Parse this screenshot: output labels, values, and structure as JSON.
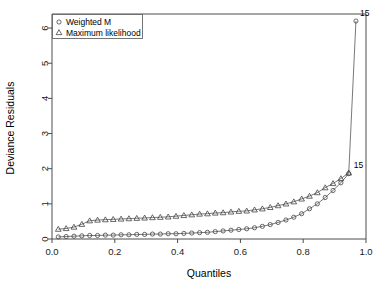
{
  "chart_data": {
    "type": "scatter",
    "title": "",
    "xlabel": "Quantiles",
    "ylabel": "Deviance Residuals",
    "xlim": [
      0.0,
      1.0
    ],
    "ylim": [
      0.0,
      6.4
    ],
    "xticks": [
      "0.0",
      "0.2",
      "0.4",
      "0.6",
      "0.8",
      "1.0"
    ],
    "xtick_values": [
      0.0,
      0.2,
      0.4,
      0.6,
      0.8,
      1.0
    ],
    "yticks": [
      "0",
      "1",
      "2",
      "3",
      "4",
      "5",
      "6"
    ],
    "ytick_values": [
      0,
      1,
      2,
      3,
      4,
      5,
      6
    ],
    "grid": false,
    "legend_position": "top-left",
    "series": [
      {
        "name": "Weighted M",
        "marker": "circle",
        "x": [
          0.02,
          0.045,
          0.07,
          0.095,
          0.12,
          0.145,
          0.17,
          0.195,
          0.22,
          0.245,
          0.27,
          0.295,
          0.32,
          0.345,
          0.37,
          0.395,
          0.42,
          0.445,
          0.47,
          0.495,
          0.52,
          0.545,
          0.57,
          0.595,
          0.62,
          0.645,
          0.67,
          0.695,
          0.72,
          0.745,
          0.77,
          0.795,
          0.82,
          0.845,
          0.87,
          0.895,
          0.92,
          0.945,
          0.968
        ],
        "y": [
          0.06,
          0.07,
          0.08,
          0.09,
          0.1,
          0.1,
          0.11,
          0.11,
          0.12,
          0.12,
          0.13,
          0.13,
          0.14,
          0.14,
          0.15,
          0.15,
          0.16,
          0.17,
          0.18,
          0.19,
          0.21,
          0.23,
          0.25,
          0.27,
          0.29,
          0.32,
          0.36,
          0.41,
          0.47,
          0.54,
          0.62,
          0.72,
          0.86,
          1.0,
          1.18,
          1.38,
          1.6,
          1.86,
          6.2
        ]
      },
      {
        "name": "Maximum likelihood",
        "marker": "triangle",
        "x": [
          0.02,
          0.045,
          0.07,
          0.095,
          0.12,
          0.145,
          0.17,
          0.195,
          0.22,
          0.245,
          0.27,
          0.295,
          0.32,
          0.345,
          0.37,
          0.395,
          0.42,
          0.445,
          0.47,
          0.495,
          0.52,
          0.545,
          0.57,
          0.595,
          0.62,
          0.645,
          0.67,
          0.695,
          0.72,
          0.745,
          0.77,
          0.795,
          0.82,
          0.845,
          0.87,
          0.895,
          0.92,
          0.945
        ],
        "y": [
          0.28,
          0.3,
          0.34,
          0.42,
          0.52,
          0.54,
          0.55,
          0.56,
          0.57,
          0.58,
          0.59,
          0.6,
          0.61,
          0.62,
          0.63,
          0.65,
          0.67,
          0.69,
          0.71,
          0.72,
          0.74,
          0.75,
          0.77,
          0.79,
          0.8,
          0.83,
          0.86,
          0.9,
          0.95,
          1.0,
          1.06,
          1.14,
          1.22,
          1.32,
          1.46,
          1.58,
          1.72,
          1.88
        ]
      }
    ],
    "annotations": [
      {
        "label": "15",
        "x": 0.968,
        "y": 6.2,
        "dx": 4,
        "dy": -5
      },
      {
        "label": "15",
        "x": 0.945,
        "y": 1.86,
        "dx": 5,
        "dy": -6
      }
    ],
    "legend_entries": [
      {
        "label": "Weighted M",
        "marker": "circle"
      },
      {
        "label": "Maximum likelihood",
        "marker": "triangle"
      }
    ]
  }
}
